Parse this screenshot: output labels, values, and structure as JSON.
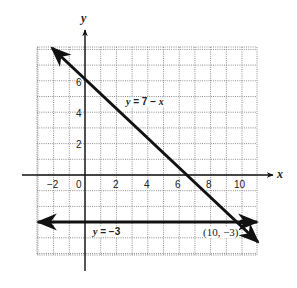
{
  "chart_data": {
    "type": "line",
    "title": "",
    "xlabel": "x",
    "ylabel": "y",
    "xlim": [
      -3,
      11
    ],
    "ylim": [
      -5,
      8
    ],
    "grid": true,
    "x_ticks": [
      -2,
      0,
      2,
      4,
      6,
      8,
      10
    ],
    "x_tick_labels": [
      "−2",
      "0",
      "2",
      "4",
      "6",
      "8",
      "10"
    ],
    "y_ticks": [
      2,
      4,
      6
    ],
    "y_tick_labels": [
      "2",
      "4",
      "6"
    ],
    "series": [
      {
        "name": "y = 7 − x",
        "equation": "y = 7 - x",
        "slope": -1,
        "intercept": 7,
        "x": [
          -2.1,
          11.1
        ],
        "y": [
          8,
          -4.3
        ],
        "style": "line with arrows"
      },
      {
        "name": "y = −3",
        "equation": "y = -3",
        "slope": 0,
        "intercept": -3,
        "x": [
          -3,
          11
        ],
        "y": [
          -3,
          -3
        ],
        "style": "line with arrows"
      }
    ],
    "annotations": [
      {
        "text": "y = 7 − x",
        "near": [
          4.5,
          4.7
        ]
      },
      {
        "text": "y = −3",
        "near": [
          1.3,
          -3.7
        ]
      },
      {
        "text": "(10, −3)",
        "point": [
          10,
          -3
        ]
      }
    ]
  },
  "labels": {
    "x_axis": "x",
    "y_axis": "y",
    "line1_prefix": "y",
    "line1_rest": " = 7 −  ",
    "line1_var": "x",
    "line2_prefix": "y",
    "line2_rest": " = −3",
    "point": "(10, −3)"
  },
  "colors": {
    "grid": "#8c8c8c",
    "axis": "#111111",
    "line": "#111111"
  }
}
